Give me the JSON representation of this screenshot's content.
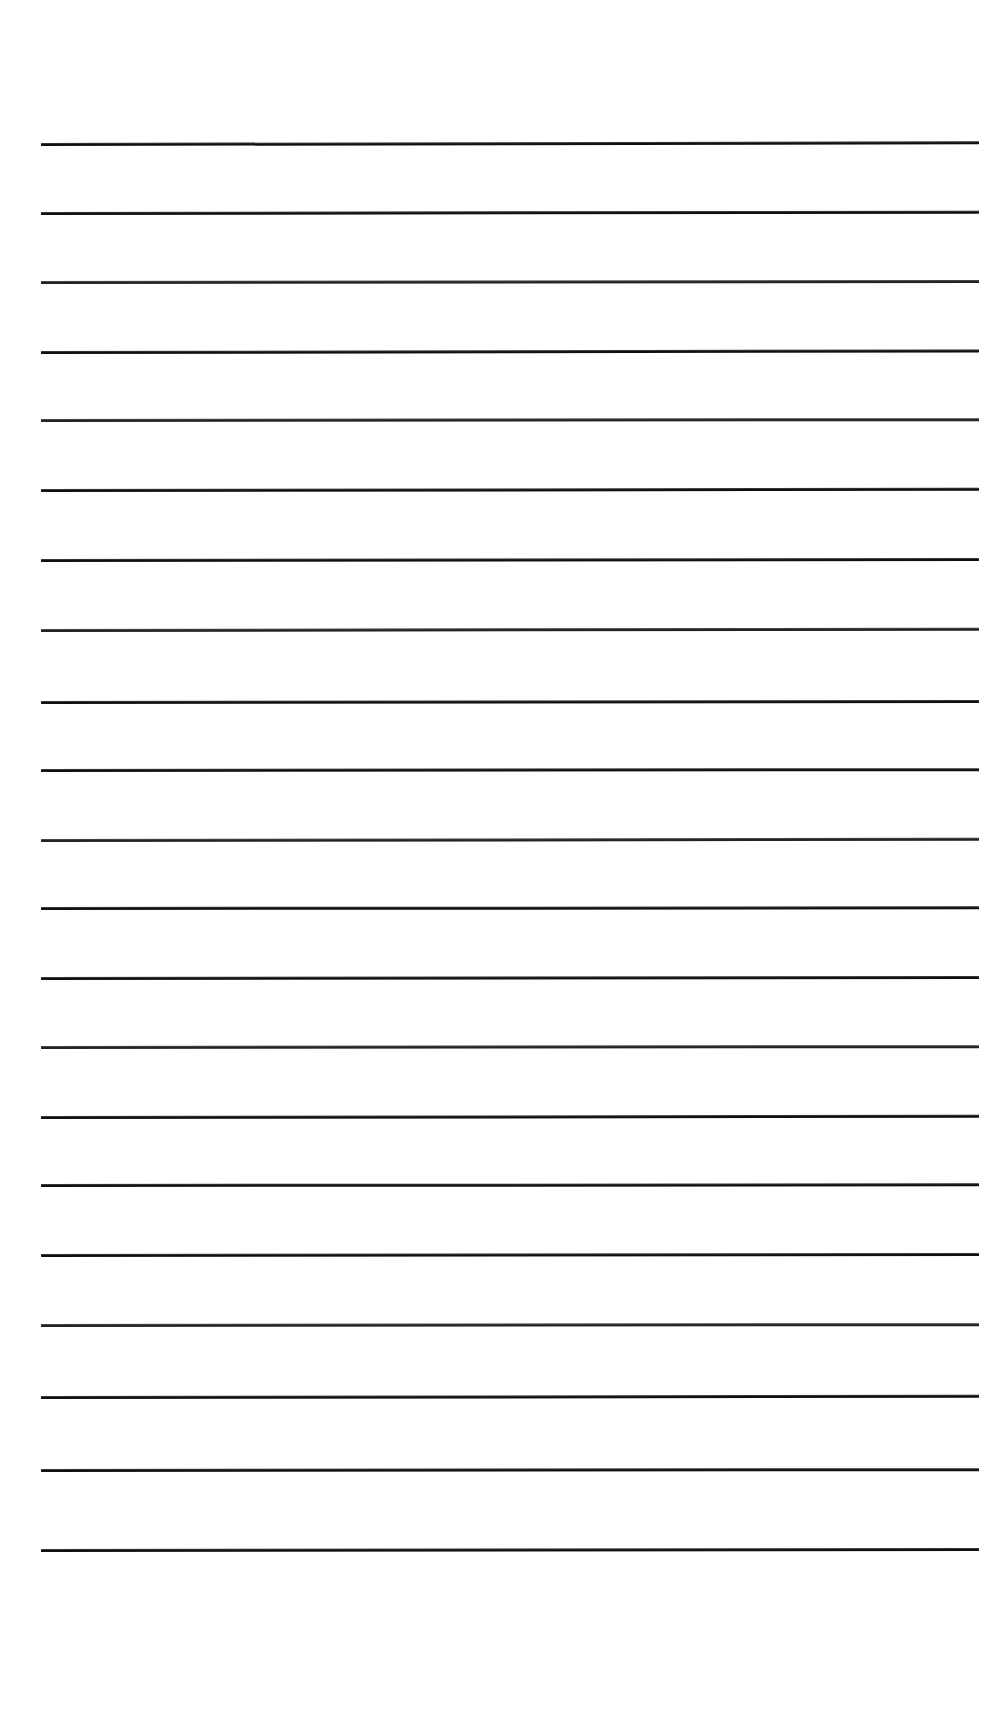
{
  "document": {
    "kind": "scanned-ruled-paper",
    "title": "Blank ruled notebook page",
    "page_width": 998,
    "page_height": 1710,
    "background_color": "#ffffff",
    "rule_color": "#171717",
    "rule_count": 21,
    "rule_left_x": 41,
    "rule_right_x": 979,
    "rule_width": 938,
    "rule_thickness": 3,
    "top_margin": 144,
    "bottom_margin": 160,
    "average_line_spacing": 70,
    "written_content": "",
    "rules": [
      {
        "index": 1,
        "y": 144,
        "thickness": 3,
        "skew": -0.1,
        "shade": "dark"
      },
      {
        "index": 2,
        "y": 213,
        "thickness": 3,
        "skew": -0.08,
        "shade": "dark"
      },
      {
        "index": 3,
        "y": 282,
        "thickness": 3,
        "skew": -0.06,
        "shade": "light"
      },
      {
        "index": 4,
        "y": 352,
        "thickness": 3,
        "skew": -0.09,
        "shade": "dark"
      },
      {
        "index": 5,
        "y": 420,
        "thickness": 3,
        "skew": -0.05,
        "shade": "light"
      },
      {
        "index": 6,
        "y": 490,
        "thickness": 3,
        "skew": -0.07,
        "shade": "dark"
      },
      {
        "index": 7,
        "y": 560,
        "thickness": 3,
        "skew": -0.06,
        "shade": "dark"
      },
      {
        "index": 8,
        "y": 630,
        "thickness": 3,
        "skew": -0.08,
        "shade": "light"
      },
      {
        "index": 9,
        "y": 702,
        "thickness": 3,
        "skew": -0.06,
        "shade": "dark"
      },
      {
        "index": 10,
        "y": 770,
        "thickness": 3,
        "skew": -0.05,
        "shade": "dark"
      },
      {
        "index": 11,
        "y": 840,
        "thickness": 3,
        "skew": -0.07,
        "shade": "light"
      },
      {
        "index": 12,
        "y": 908,
        "thickness": 3,
        "skew": -0.04,
        "shade": "dark"
      },
      {
        "index": 13,
        "y": 978,
        "thickness": 3,
        "skew": -0.06,
        "shade": "dark"
      },
      {
        "index": 14,
        "y": 1047,
        "thickness": 3,
        "skew": -0.05,
        "shade": "light"
      },
      {
        "index": 15,
        "y": 1117,
        "thickness": 3,
        "skew": -0.07,
        "shade": "dark"
      },
      {
        "index": 16,
        "y": 1185,
        "thickness": 3,
        "skew": -0.04,
        "shade": "dark"
      },
      {
        "index": 17,
        "y": 1255,
        "thickness": 3,
        "skew": -0.06,
        "shade": "dark"
      },
      {
        "index": 18,
        "y": 1325,
        "thickness": 3,
        "skew": -0.05,
        "shade": "light"
      },
      {
        "index": 19,
        "y": 1397,
        "thickness": 3,
        "skew": -0.07,
        "shade": "dark"
      },
      {
        "index": 20,
        "y": 1470,
        "thickness": 3,
        "skew": -0.05,
        "shade": "dark"
      },
      {
        "index": 21,
        "y": 1550,
        "thickness": 3,
        "skew": -0.06,
        "shade": "dark"
      }
    ]
  }
}
